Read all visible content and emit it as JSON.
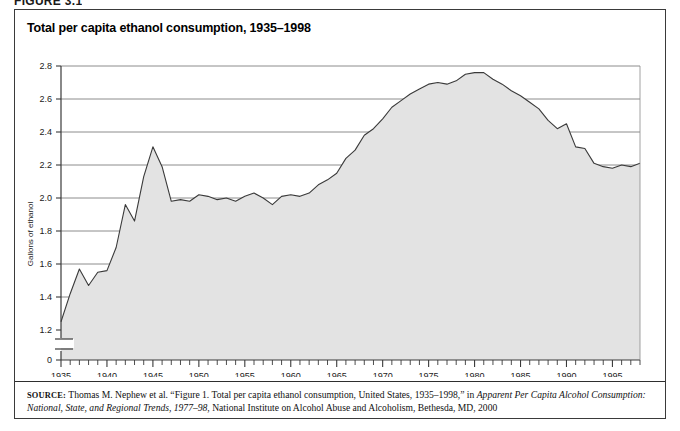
{
  "figure": {
    "figure_label": "FIGURE 3.1",
    "title": "Total per capita ethanol consumption, 1935–1998",
    "source_prefix": "SOURCE:",
    "source_text_1": "Thomas M. Nephew et al.  “Figure 1. Total per capita ethanol consumption, United States, 1935–1998,”  in ",
    "source_italic_1": "Apparent Per Capita Alcohol Consumption: National, State, and Regional Trends, 1977–98",
    "source_text_2": ", National Institute on Alcohol Abuse and Alcoholism, Bethesda, MD, 2000"
  },
  "chart_data": {
    "type": "area",
    "title": "Total per capita ethanol consumption, 1935–1998",
    "xlabel": "",
    "ylabel": "Gallons of ethanol",
    "ylim": [
      1.1,
      2.8
    ],
    "y_axis_break": true,
    "y_zero_shown": true,
    "xlim": [
      1935,
      1998
    ],
    "grid": true,
    "grid_orientation": "horizontal",
    "legend": "none",
    "line_color": "#3a3a3a",
    "fill_color": "#e3e3e3",
    "y_ticks": [
      "0",
      "1.2",
      "1.4",
      "1.6",
      "1.8",
      "2.0",
      "2.2",
      "2.4",
      "2.6",
      "2.8"
    ],
    "y_tick_values": [
      2.8,
      2.6,
      2.4,
      2.2,
      2.0,
      1.8,
      1.6,
      1.4,
      1.2
    ],
    "x_ticks": [
      "1935",
      "1940",
      "1945",
      "1950",
      "1955",
      "1960",
      "1965",
      "1970",
      "1975",
      "1980",
      "1985",
      "1990",
      "1995"
    ],
    "x_tick_values": [
      1935,
      1940,
      1945,
      1950,
      1955,
      1960,
      1965,
      1970,
      1975,
      1980,
      1985,
      1990,
      1995
    ],
    "x_minor_tick_interval": 1,
    "x": [
      1935,
      1936,
      1937,
      1938,
      1939,
      1940,
      1941,
      1942,
      1943,
      1944,
      1945,
      1946,
      1947,
      1948,
      1949,
      1950,
      1951,
      1952,
      1953,
      1954,
      1955,
      1956,
      1957,
      1958,
      1959,
      1960,
      1961,
      1962,
      1963,
      1964,
      1965,
      1966,
      1967,
      1968,
      1969,
      1970,
      1971,
      1972,
      1973,
      1974,
      1975,
      1976,
      1977,
      1978,
      1979,
      1980,
      1981,
      1982,
      1983,
      1984,
      1985,
      1986,
      1987,
      1988,
      1989,
      1990,
      1991,
      1992,
      1993,
      1994,
      1995,
      1996,
      1997,
      1998
    ],
    "values": [
      1.25,
      1.42,
      1.57,
      1.47,
      1.55,
      1.56,
      1.7,
      1.96,
      1.86,
      2.13,
      2.31,
      2.19,
      1.98,
      1.99,
      1.98,
      2.02,
      2.01,
      1.99,
      2.0,
      1.98,
      2.01,
      2.03,
      2.0,
      1.96,
      2.01,
      2.02,
      2.01,
      2.03,
      2.08,
      2.11,
      2.15,
      2.24,
      2.29,
      2.38,
      2.42,
      2.48,
      2.55,
      2.59,
      2.63,
      2.66,
      2.69,
      2.7,
      2.69,
      2.71,
      2.75,
      2.76,
      2.76,
      2.72,
      2.69,
      2.65,
      2.62,
      2.58,
      2.54,
      2.47,
      2.42,
      2.45,
      2.31,
      2.3,
      2.21,
      2.19,
      2.18,
      2.2,
      2.19,
      2.21
    ]
  }
}
